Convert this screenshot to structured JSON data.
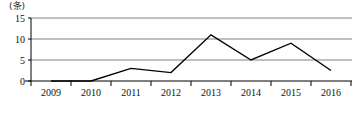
{
  "chart_data": {
    "type": "line",
    "title": "",
    "subtitle": "",
    "unit_label": "(条)",
    "xlabel": "",
    "ylabel": "",
    "categories": [
      "2009",
      "2010",
      "2011",
      "2012",
      "2013",
      "2014",
      "2015",
      "2016"
    ],
    "values": [
      0,
      0,
      3,
      2,
      11,
      5,
      9,
      2.5
    ],
    "series": [
      {
        "name": "",
        "values": [
          0,
          0,
          3,
          2,
          11,
          5,
          9,
          2.5
        ],
        "color": "#000000"
      }
    ],
    "ylim": [
      0,
      15
    ],
    "yticks": [
      0,
      5,
      10,
      15
    ],
    "ytick_labels": [
      "0",
      "5",
      "10",
      "15"
    ],
    "grid": true,
    "grid_color": "#808080",
    "axis_color": "#000000",
    "legend": false,
    "legend_position": "none",
    "annotations": []
  },
  "axis": {
    "unit": "(条)",
    "y_labels": [
      "15",
      "10",
      "5",
      "0"
    ],
    "x_labels": [
      "2009",
      "2010",
      "2011",
      "2012",
      "2013",
      "2014",
      "2015",
      "2016"
    ]
  }
}
